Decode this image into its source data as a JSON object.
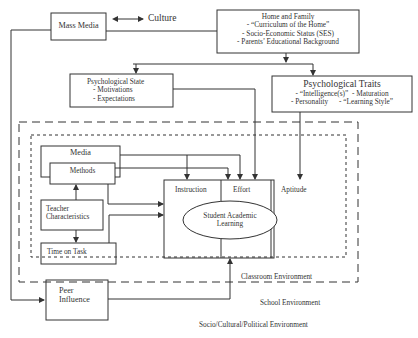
{
  "diagram": {
    "nodes": {
      "mass_media": {
        "label": "Mass Media"
      },
      "culture": {
        "label": "Culture"
      },
      "home_family": {
        "title": "Home and Family",
        "items": [
          "- “Curriculum of the Home”",
          "- Socio-Economic Status (SES)",
          "- Parents’ Educational Background"
        ]
      },
      "psych_state": {
        "title": "Psychological State",
        "items": [
          "- Motivations",
          "- Expectations"
        ]
      },
      "psych_traits": {
        "title": "Psychological Traits",
        "row1": "- “Intelligence(s)”  - Maturation",
        "row2": "- Personality      - “Learning Style”"
      },
      "media": {
        "label": "Media"
      },
      "methods": {
        "label": "Methods"
      },
      "teacher": {
        "line1": "Teacher",
        "line2": "Characteristics"
      },
      "time_on_task": {
        "label": "Time on Task"
      },
      "peer": {
        "line1": "Peer",
        "line2": "Influence"
      },
      "instruction": {
        "label": "Instruction"
      },
      "effort": {
        "label": "Effort"
      },
      "aptitude": {
        "label": "Aptitude"
      },
      "student_learning": {
        "line1": "Student Academic",
        "line2": "Learning"
      }
    },
    "environments": {
      "classroom": "Classroom Environment",
      "school": "School Environment",
      "socio": "Socio/Cultural/Political Environment"
    },
    "colors": {
      "stroke": "#333333",
      "background": "#ffffff"
    }
  }
}
